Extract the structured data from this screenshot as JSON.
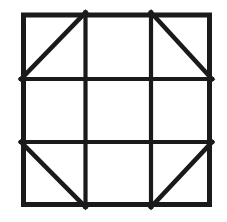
{
  "figure": {
    "title": "Nine-patch square grid with corner diagonals",
    "canvas": {
      "width": 227,
      "height": 222,
      "background_color": "#ffffff"
    },
    "style": {
      "line_color": "#1a1a1a",
      "outer_stroke_width": 5,
      "inner_stroke_width": 4.2,
      "diagonal_stroke_width": 4.6,
      "cell_fill": "#ffffff"
    },
    "outer_square": {
      "label": "outer square border",
      "left": 21,
      "top": 12.5,
      "right": 212,
      "bottom": 207
    },
    "grid": {
      "rows": 3,
      "columns": 3,
      "vertical_divider_x": [
        85.5,
        151
      ],
      "horizontal_divider_y": [
        79,
        142
      ],
      "column_edges_x": [
        21,
        85.5,
        151,
        212
      ],
      "row_edges_y": [
        12.5,
        79,
        142,
        207
      ]
    },
    "cells": [
      {
        "id": "cell-r1c1",
        "row": 1,
        "column": 1,
        "position": "top-left",
        "diagonal": "slash",
        "diagonal_description": "bottom-left to top-right",
        "x1": 21,
        "y1": 79,
        "x2": 85.5,
        "y2": 12.5
      },
      {
        "id": "cell-r1c2",
        "row": 1,
        "column": 2,
        "position": "top-center",
        "diagonal": "none",
        "diagonal_description": "empty cell"
      },
      {
        "id": "cell-r1c3",
        "row": 1,
        "column": 3,
        "position": "top-right",
        "diagonal": "backslash",
        "diagonal_description": "top-left to bottom-right",
        "x1": 151,
        "y1": 12.5,
        "x2": 212,
        "y2": 79
      },
      {
        "id": "cell-r2c1",
        "row": 2,
        "column": 1,
        "position": "middle-left",
        "diagonal": "none",
        "diagonal_description": "empty cell"
      },
      {
        "id": "cell-r2c2",
        "row": 2,
        "column": 2,
        "position": "center",
        "diagonal": "none",
        "diagonal_description": "empty cell"
      },
      {
        "id": "cell-r2c3",
        "row": 2,
        "column": 3,
        "position": "middle-right",
        "diagonal": "none",
        "diagonal_description": "empty cell"
      },
      {
        "id": "cell-r3c1",
        "row": 3,
        "column": 1,
        "position": "bottom-left",
        "diagonal": "backslash",
        "diagonal_description": "top-left to bottom-right",
        "x1": 21,
        "y1": 142,
        "x2": 85.5,
        "y2": 207
      },
      {
        "id": "cell-r3c2",
        "row": 3,
        "column": 2,
        "position": "bottom-center",
        "diagonal": "none",
        "diagonal_description": "empty cell"
      },
      {
        "id": "cell-r3c3",
        "row": 3,
        "column": 3,
        "position": "bottom-right",
        "diagonal": "slash",
        "diagonal_description": "bottom-left to top-right",
        "x1": 151,
        "y1": 207,
        "x2": 212,
        "y2": 142
      }
    ]
  }
}
